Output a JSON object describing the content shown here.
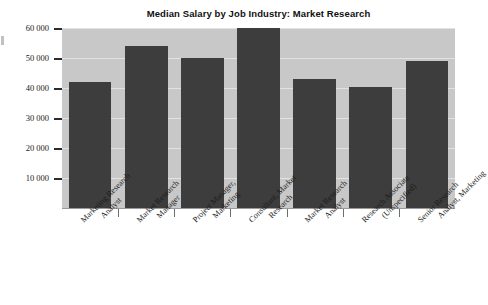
{
  "chart_data": {
    "type": "bar",
    "title": "Median Salary by Job Industry: Market Research",
    "xlabel": "",
    "ylabel": "",
    "ylim": [
      0,
      60000
    ],
    "grid": true,
    "legend": "none",
    "y_tick_labels": [
      "60 000",
      "50 000",
      "40 000",
      "30 000",
      "20 000",
      "10 000"
    ],
    "y_ticks": [
      60000,
      50000,
      40000,
      30000,
      20000,
      10000
    ],
    "categories": [
      "Marketing Research Analyst",
      "Market Research Manager",
      "Project Manager, Marketing",
      "Consultant, Market Research",
      "Market Research Analyst",
      "Research Associate (Unspecified)",
      "Senior Research Analyst, Marketing"
    ],
    "category_lines": [
      [
        "Marketing Research",
        "Analyst"
      ],
      [
        "Market Research",
        "Manager"
      ],
      [
        "Project Manager,",
        "Marketing"
      ],
      [
        "Consultant, Market",
        "Research"
      ],
      [
        "Market Research",
        "Analyst"
      ],
      [
        "Research Associate",
        "(Unspecified)"
      ],
      [
        "Senior Research",
        "Analyst, Marketing"
      ]
    ],
    "values": [
      42000,
      54000,
      50000,
      60000,
      43000,
      40500,
      49000
    ],
    "bar_color": "#3d3d3d",
    "plot_background_color": "#c8c8c8",
    "gridline_color": "#e2e2e2",
    "figure_background_color": "#ffffff"
  }
}
